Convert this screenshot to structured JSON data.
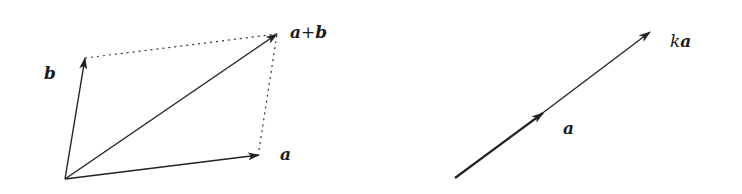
{
  "figure": {
    "left_panel": {
      "title": "Parallelogram rule for vector addition",
      "vectors": [
        {
          "id": "a",
          "label": "a",
          "style": "solid"
        },
        {
          "id": "b",
          "label": "b",
          "style": "solid"
        },
        {
          "id": "a_plus_b",
          "label_parts": [
            "a",
            "+",
            "b"
          ],
          "style": "solid"
        }
      ],
      "guides": [
        {
          "from": "b",
          "to": "a_plus_b",
          "style": "dotted"
        },
        {
          "from": "a",
          "to": "a_plus_b",
          "style": "dotted"
        }
      ]
    },
    "right_panel": {
      "title": "Scalar multiplication",
      "vectors": [
        {
          "id": "a",
          "label": "a"
        },
        {
          "id": "ka",
          "label_parts": [
            "k",
            "a"
          ]
        }
      ]
    },
    "colors": {
      "stroke": "#222222",
      "text": "#1a1a1a",
      "background": "#ffffff"
    }
  }
}
